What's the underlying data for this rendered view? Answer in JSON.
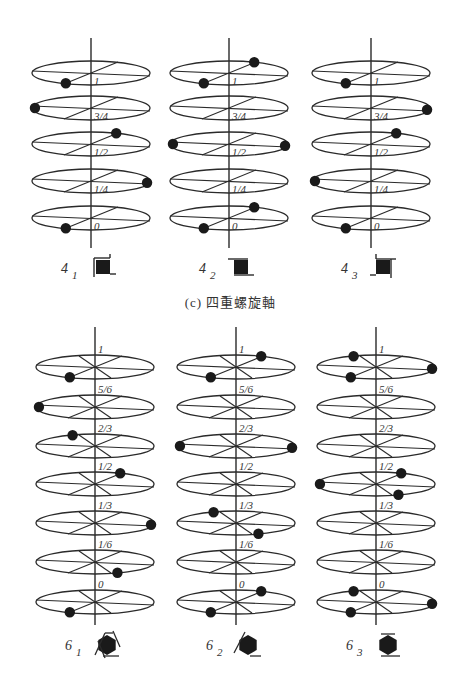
{
  "caption": "(c) 四重螺旋軸",
  "colors": {
    "line": "#2a2a2a",
    "dot": "#1a1a1a",
    "symbol_fill": "#1a1a1a",
    "label": "#333333"
  },
  "fourfold": {
    "levels": [
      "1",
      "3/4",
      "1/2",
      "1/4",
      "0"
    ],
    "level_y": [
      73,
      108,
      144,
      181,
      218
    ],
    "axes": [
      {
        "name": "4_1",
        "base": "4",
        "sub": "1",
        "cx": 91,
        "dots": [
          {
            "level": "1",
            "angle": "front-left"
          },
          {
            "level": "3/4",
            "angle": "left"
          },
          {
            "level": "1/2",
            "angle": "back-right"
          },
          {
            "level": "1/4",
            "angle": "right"
          },
          {
            "level": "0",
            "angle": "front-left"
          }
        ]
      },
      {
        "name": "4_2",
        "base": "4",
        "sub": "2",
        "cx": 229,
        "dots": [
          {
            "level": "1",
            "angle": "front-left"
          },
          {
            "level": "1",
            "angle": "back-right"
          },
          {
            "level": "1/2",
            "angle": "left"
          },
          {
            "level": "1/2",
            "angle": "right"
          },
          {
            "level": "0",
            "angle": "front-left"
          },
          {
            "level": "0",
            "angle": "back-right"
          }
        ]
      },
      {
        "name": "4_3",
        "base": "4",
        "sub": "3",
        "cx": 371,
        "dots": [
          {
            "level": "1",
            "angle": "front-left"
          },
          {
            "level": "3/4",
            "angle": "right"
          },
          {
            "level": "1/2",
            "angle": "back-right"
          },
          {
            "level": "1/4",
            "angle": "left"
          },
          {
            "level": "0",
            "angle": "front-left"
          }
        ]
      }
    ]
  },
  "sixfold": {
    "levels": [
      "1",
      "5/6",
      "2/3",
      "1/2",
      "1/3",
      "1/6",
      "0"
    ],
    "level_y": [
      367,
      407,
      446,
      484,
      523,
      562,
      602
    ],
    "axes": [
      {
        "name": "6_1",
        "base": "6",
        "sub": "1",
        "cx": 95,
        "dots": [
          {
            "level": "1",
            "angle": "front-left"
          },
          {
            "level": "5/6",
            "angle": "left"
          },
          {
            "level": "2/3",
            "angle": "back-left"
          },
          {
            "level": "1/2",
            "angle": "back-right"
          },
          {
            "level": "1/3",
            "angle": "right"
          },
          {
            "level": "1/6",
            "angle": "front-right"
          },
          {
            "level": "0",
            "angle": "front-left"
          }
        ]
      },
      {
        "name": "6_2",
        "base": "6",
        "sub": "2",
        "cx": 236,
        "dots": [
          {
            "level": "1",
            "angle": "front-left"
          },
          {
            "level": "1",
            "angle": "back-right"
          },
          {
            "level": "2/3",
            "angle": "left"
          },
          {
            "level": "2/3",
            "angle": "right"
          },
          {
            "level": "1/3",
            "angle": "back-left"
          },
          {
            "level": "1/3",
            "angle": "front-right"
          },
          {
            "level": "0",
            "angle": "front-left"
          },
          {
            "level": "0",
            "angle": "back-right"
          }
        ]
      },
      {
        "name": "6_3",
        "base": "6",
        "sub": "3",
        "cx": 376,
        "dots": [
          {
            "level": "1",
            "angle": "front-left"
          },
          {
            "level": "1",
            "angle": "back-left"
          },
          {
            "level": "1",
            "angle": "right"
          },
          {
            "level": "1/2",
            "angle": "left"
          },
          {
            "level": "1/2",
            "angle": "back-right"
          },
          {
            "level": "1/2",
            "angle": "front-right"
          },
          {
            "level": "0",
            "angle": "front-left"
          },
          {
            "level": "0",
            "angle": "back-left"
          },
          {
            "level": "0",
            "angle": "right"
          }
        ]
      }
    ]
  }
}
